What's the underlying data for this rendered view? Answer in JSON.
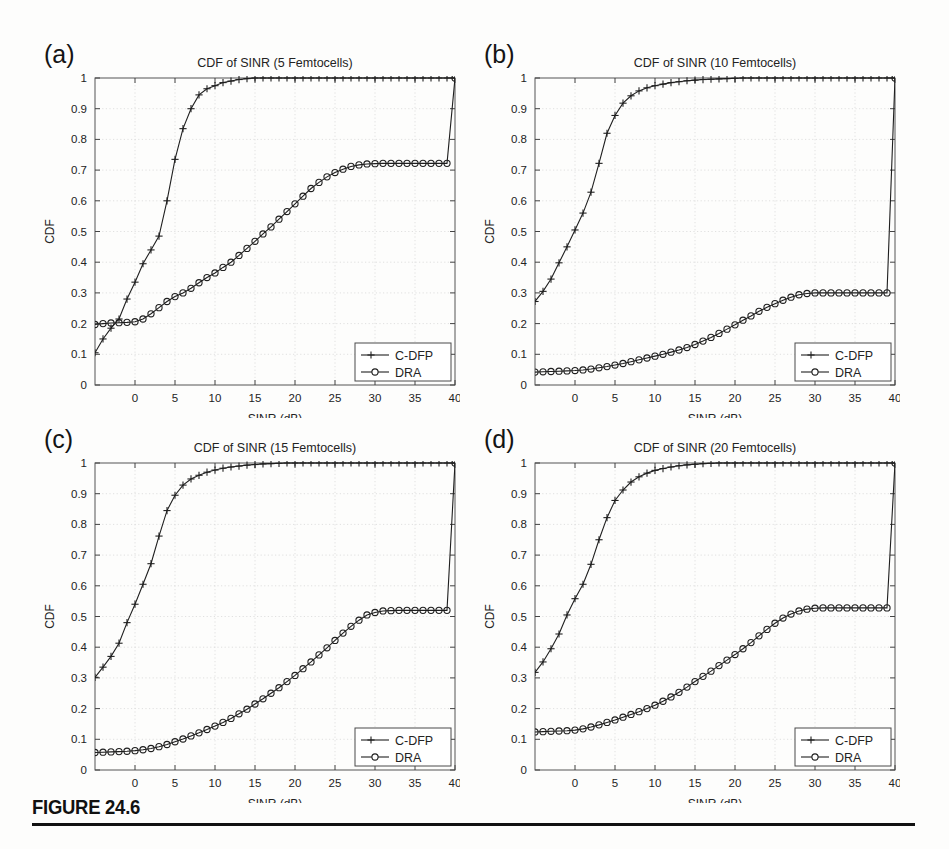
{
  "figure": {
    "caption_label": "FIGURE 24.6"
  },
  "common": {
    "xlabel": "SINR (dB)",
    "ylabel": "CDF",
    "xlim": [
      -5,
      40
    ],
    "ylim": [
      0,
      1
    ],
    "xticks": [
      0,
      5,
      10,
      15,
      20,
      25,
      30,
      35,
      40
    ],
    "xtick_labels": [
      "0",
      "5",
      "10",
      "15",
      "20",
      "25",
      "30",
      "35",
      "40"
    ],
    "yticks": [
      0,
      0.1,
      0.2,
      0.3,
      0.4,
      0.5,
      0.6,
      0.7,
      0.8,
      0.9,
      1
    ],
    "ytick_labels": [
      "0",
      "0.1",
      "0.2",
      "0.3",
      "0.4",
      "0.5",
      "0.6",
      "0.7",
      "0.8",
      "0.9",
      "1"
    ],
    "grid": true,
    "legend_position": "lower-right",
    "legend_entries": [
      {
        "name": "C-DFP",
        "marker": "plus"
      },
      {
        "name": "DRA",
        "marker": "circle"
      }
    ],
    "line_color": "#1f1f1f"
  },
  "chart_data": [
    {
      "id": "a",
      "panel_letter": "(a)",
      "type": "line",
      "title": "CDF of SINR (5 Femtocells)",
      "xlabel": "SINR (dB)",
      "ylabel": "CDF",
      "xlim": [
        -5,
        40
      ],
      "ylim": [
        0,
        1
      ],
      "grid": true,
      "series": [
        {
          "name": "C-DFP",
          "marker": "plus",
          "x": [
            -5,
            -4,
            -3,
            -2,
            -1,
            0,
            1,
            2,
            3,
            4,
            5,
            6,
            7,
            8,
            9,
            10,
            11,
            12,
            13,
            14,
            15,
            16,
            17,
            18,
            19,
            20,
            21,
            22,
            23,
            24,
            25,
            26,
            27,
            28,
            29,
            30,
            31,
            32,
            33,
            34,
            35,
            36,
            37,
            38,
            39,
            40
          ],
          "y": [
            0.105,
            0.15,
            0.185,
            0.215,
            0.28,
            0.335,
            0.395,
            0.44,
            0.485,
            0.6,
            0.735,
            0.835,
            0.9,
            0.945,
            0.965,
            0.975,
            0.985,
            0.99,
            0.995,
            0.998,
            1.0,
            1.0,
            1.0,
            1.0,
            1.0,
            1.0,
            1.0,
            1.0,
            1.0,
            1.0,
            1.0,
            1.0,
            1.0,
            1.0,
            1.0,
            1.0,
            1.0,
            1.0,
            1.0,
            1.0,
            1.0,
            1.0,
            1.0,
            1.0,
            1.0,
            1.0
          ]
        },
        {
          "name": "DRA",
          "marker": "circle",
          "x": [
            -5,
            -4,
            -3,
            -2,
            -1,
            0,
            1,
            2,
            3,
            4,
            5,
            6,
            7,
            8,
            9,
            10,
            11,
            12,
            13,
            14,
            15,
            16,
            17,
            18,
            19,
            20,
            21,
            22,
            23,
            24,
            25,
            26,
            27,
            28,
            29,
            30,
            31,
            32,
            33,
            34,
            35,
            36,
            37,
            38,
            39,
            40
          ],
          "y": [
            0.197,
            0.2,
            0.202,
            0.203,
            0.204,
            0.206,
            0.215,
            0.232,
            0.252,
            0.272,
            0.288,
            0.3,
            0.315,
            0.333,
            0.35,
            0.365,
            0.383,
            0.4,
            0.422,
            0.445,
            0.468,
            0.492,
            0.515,
            0.54,
            0.565,
            0.59,
            0.615,
            0.64,
            0.66,
            0.678,
            0.692,
            0.703,
            0.712,
            0.717,
            0.72,
            0.721,
            0.722,
            0.722,
            0.722,
            0.722,
            0.722,
            0.722,
            0.722,
            0.722,
            0.722,
            1.0
          ]
        }
      ]
    },
    {
      "id": "b",
      "panel_letter": "(b)",
      "type": "line",
      "title": "CDF of SINR (10 Femtocells)",
      "xlabel": "SINR (dB)",
      "ylabel": "CDF",
      "xlim": [
        -5,
        40
      ],
      "ylim": [
        0,
        1
      ],
      "grid": true,
      "series": [
        {
          "name": "C-DFP",
          "marker": "plus",
          "x": [
            -5,
            -4,
            -3,
            -2,
            -1,
            0,
            1,
            2,
            3,
            4,
            5,
            6,
            7,
            8,
            9,
            10,
            11,
            12,
            13,
            14,
            15,
            16,
            17,
            18,
            19,
            20,
            21,
            22,
            23,
            24,
            25,
            26,
            27,
            28,
            29,
            30,
            31,
            32,
            33,
            34,
            35,
            36,
            37,
            38,
            39,
            40
          ],
          "y": [
            0.272,
            0.305,
            0.345,
            0.398,
            0.45,
            0.505,
            0.56,
            0.628,
            0.722,
            0.82,
            0.878,
            0.918,
            0.942,
            0.958,
            0.968,
            0.975,
            0.98,
            0.985,
            0.988,
            0.991,
            0.993,
            0.995,
            0.996,
            0.997,
            0.998,
            0.999,
            1.0,
            1.0,
            1.0,
            1.0,
            1.0,
            1.0,
            1.0,
            1.0,
            1.0,
            1.0,
            1.0,
            1.0,
            1.0,
            1.0,
            1.0,
            1.0,
            1.0,
            1.0,
            1.0,
            1.0
          ]
        },
        {
          "name": "DRA",
          "marker": "circle",
          "x": [
            -5,
            -4,
            -3,
            -2,
            -1,
            0,
            1,
            2,
            3,
            4,
            5,
            6,
            7,
            8,
            9,
            10,
            11,
            12,
            13,
            14,
            15,
            16,
            17,
            18,
            19,
            20,
            21,
            22,
            23,
            24,
            25,
            26,
            27,
            28,
            29,
            30,
            31,
            32,
            33,
            34,
            35,
            36,
            37,
            38,
            39,
            40
          ],
          "y": [
            0.042,
            0.043,
            0.044,
            0.045,
            0.046,
            0.047,
            0.049,
            0.052,
            0.056,
            0.06,
            0.065,
            0.07,
            0.076,
            0.082,
            0.088,
            0.094,
            0.1,
            0.107,
            0.114,
            0.122,
            0.132,
            0.143,
            0.155,
            0.168,
            0.182,
            0.196,
            0.211,
            0.225,
            0.24,
            0.253,
            0.265,
            0.276,
            0.286,
            0.294,
            0.298,
            0.3,
            0.3,
            0.3,
            0.3,
            0.3,
            0.3,
            0.3,
            0.3,
            0.3,
            0.3,
            1.0
          ]
        }
      ]
    },
    {
      "id": "c",
      "panel_letter": "(c)",
      "type": "line",
      "title": "CDF of SINR (15 Femtocells)",
      "xlabel": "SINR (dB)",
      "ylabel": "CDF",
      "xlim": [
        -5,
        40
      ],
      "ylim": [
        0,
        1
      ],
      "grid": true,
      "series": [
        {
          "name": "C-DFP",
          "marker": "plus",
          "x": [
            -5,
            -4,
            -3,
            -2,
            -1,
            0,
            1,
            2,
            3,
            4,
            5,
            6,
            7,
            8,
            9,
            10,
            11,
            12,
            13,
            14,
            15,
            16,
            17,
            18,
            19,
            20,
            21,
            22,
            23,
            24,
            25,
            26,
            27,
            28,
            29,
            30,
            31,
            32,
            33,
            34,
            35,
            36,
            37,
            38,
            39,
            40
          ],
          "y": [
            0.302,
            0.335,
            0.37,
            0.413,
            0.48,
            0.54,
            0.605,
            0.672,
            0.762,
            0.845,
            0.895,
            0.928,
            0.948,
            0.96,
            0.97,
            0.977,
            0.983,
            0.987,
            0.99,
            0.993,
            0.995,
            0.997,
            0.998,
            0.999,
            1.0,
            1.0,
            1.0,
            1.0,
            1.0,
            1.0,
            1.0,
            1.0,
            1.0,
            1.0,
            1.0,
            1.0,
            1.0,
            1.0,
            1.0,
            1.0,
            1.0,
            1.0,
            1.0,
            1.0,
            1.0,
            1.0
          ]
        },
        {
          "name": "DRA",
          "marker": "circle",
          "x": [
            -5,
            -4,
            -3,
            -2,
            -1,
            0,
            1,
            2,
            3,
            4,
            5,
            6,
            7,
            8,
            9,
            10,
            11,
            12,
            13,
            14,
            15,
            16,
            17,
            18,
            19,
            20,
            21,
            22,
            23,
            24,
            25,
            26,
            27,
            28,
            29,
            30,
            31,
            32,
            33,
            34,
            35,
            36,
            37,
            38,
            39,
            40
          ],
          "y": [
            0.057,
            0.058,
            0.059,
            0.06,
            0.061,
            0.063,
            0.066,
            0.07,
            0.076,
            0.083,
            0.092,
            0.101,
            0.111,
            0.121,
            0.132,
            0.143,
            0.155,
            0.168,
            0.183,
            0.198,
            0.215,
            0.232,
            0.25,
            0.268,
            0.288,
            0.308,
            0.33,
            0.352,
            0.375,
            0.398,
            0.422,
            0.446,
            0.468,
            0.488,
            0.505,
            0.513,
            0.518,
            0.519,
            0.52,
            0.52,
            0.52,
            0.52,
            0.52,
            0.52,
            0.52,
            1.0
          ]
        }
      ]
    },
    {
      "id": "d",
      "panel_letter": "(d)",
      "type": "line",
      "title": "CDF of SINR (20 Femtocells)",
      "xlabel": "SINR (dB)",
      "ylabel": "CDF",
      "xlim": [
        -5,
        40
      ],
      "ylim": [
        0,
        1
      ],
      "grid": true,
      "series": [
        {
          "name": "C-DFP",
          "marker": "plus",
          "x": [
            -5,
            -4,
            -3,
            -2,
            -1,
            0,
            1,
            2,
            3,
            4,
            5,
            6,
            7,
            8,
            9,
            10,
            11,
            12,
            13,
            14,
            15,
            16,
            17,
            18,
            19,
            20,
            21,
            22,
            23,
            24,
            25,
            26,
            27,
            28,
            29,
            30,
            31,
            32,
            33,
            34,
            35,
            36,
            37,
            38,
            39,
            40
          ],
          "y": [
            0.318,
            0.352,
            0.395,
            0.443,
            0.505,
            0.558,
            0.605,
            0.67,
            0.75,
            0.822,
            0.878,
            0.912,
            0.938,
            0.955,
            0.967,
            0.976,
            0.982,
            0.987,
            0.991,
            0.994,
            0.996,
            0.998,
            0.999,
            1.0,
            1.0,
            1.0,
            1.0,
            1.0,
            1.0,
            1.0,
            1.0,
            1.0,
            1.0,
            1.0,
            1.0,
            1.0,
            1.0,
            1.0,
            1.0,
            1.0,
            1.0,
            1.0,
            1.0,
            1.0,
            1.0,
            1.0
          ]
        },
        {
          "name": "DRA",
          "marker": "circle",
          "x": [
            -5,
            -4,
            -3,
            -2,
            -1,
            0,
            1,
            2,
            3,
            4,
            5,
            6,
            7,
            8,
            9,
            10,
            11,
            12,
            13,
            14,
            15,
            16,
            17,
            18,
            19,
            20,
            21,
            22,
            23,
            24,
            25,
            26,
            27,
            28,
            29,
            30,
            31,
            32,
            33,
            34,
            35,
            36,
            37,
            38,
            39,
            40
          ],
          "y": [
            0.124,
            0.125,
            0.126,
            0.127,
            0.128,
            0.13,
            0.134,
            0.14,
            0.147,
            0.155,
            0.163,
            0.172,
            0.181,
            0.19,
            0.2,
            0.211,
            0.224,
            0.238,
            0.253,
            0.27,
            0.288,
            0.305,
            0.322,
            0.34,
            0.358,
            0.376,
            0.395,
            0.415,
            0.437,
            0.458,
            0.478,
            0.495,
            0.508,
            0.518,
            0.524,
            0.527,
            0.528,
            0.528,
            0.528,
            0.528,
            0.528,
            0.528,
            0.528,
            0.528,
            0.528,
            1.0
          ]
        }
      ]
    }
  ]
}
